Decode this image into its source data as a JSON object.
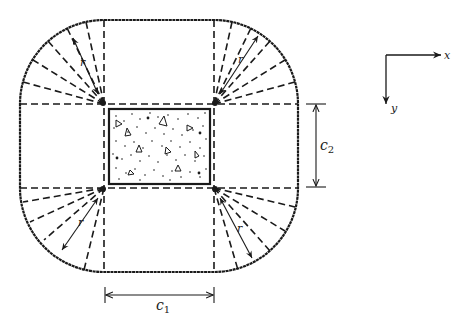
{
  "diagram": {
    "labels": {
      "radius": "r",
      "c1_main": "c",
      "c1_sub": "1",
      "c2_main": "c",
      "c2_sub": "2",
      "x_axis": "x",
      "y_axis": "y"
    },
    "colors": {
      "ink": "#1a1a1a",
      "background": "#ffffff"
    }
  }
}
